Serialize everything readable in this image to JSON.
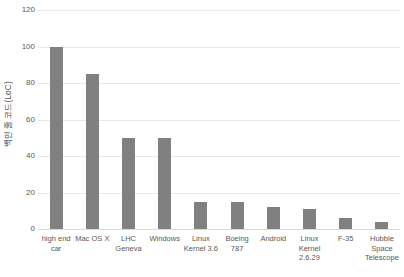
{
  "chart_data": {
    "type": "bar",
    "title": "",
    "subtitle": "",
    "xlabel": "",
    "ylabel": "백만 줄 코드(LoC)",
    "ylim": [
      0,
      120
    ],
    "yticks": [
      0,
      20,
      40,
      60,
      80,
      100,
      120
    ],
    "grid": true,
    "legend": false,
    "legend_position": "none",
    "bar_color": "#808080",
    "gridline_color": "#e8e8e8",
    "text_color": "#595959",
    "categories": [
      "high end car",
      "Mac OS X",
      "LHC Geneva",
      "Windows",
      "Linux Kernel 3.6",
      "Boeing 787",
      "Android",
      "Linux Kernel 2.6.29",
      "F-35",
      "Hubble Space Telescope"
    ],
    "values": [
      100,
      85,
      50,
      50,
      15,
      15,
      12,
      11,
      6,
      4
    ]
  }
}
